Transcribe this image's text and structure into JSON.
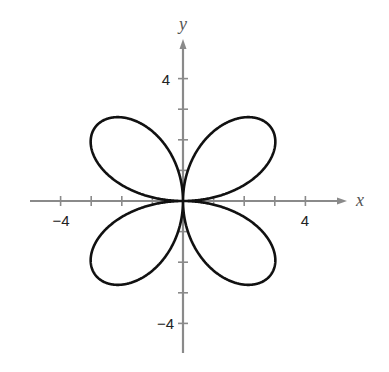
{
  "chart_data": {
    "type": "line",
    "title": "",
    "xlabel": "x",
    "ylabel": "y",
    "equation": "r = 4 sin 2θ",
    "xlim": [
      -5,
      5.3
    ],
    "ylim": [
      -5.1,
      5.2
    ],
    "x_tick_labels": [
      "-4",
      "4"
    ],
    "y_tick_labels": [
      "4",
      "-4"
    ],
    "x_ticks": [
      -4,
      -3,
      -2,
      -1,
      1,
      2,
      3,
      4
    ],
    "y_ticks": [
      -4,
      -3,
      -2,
      -1,
      1,
      2,
      3,
      4
    ],
    "grid": false,
    "series": [
      {
        "name": "rose curve",
        "polar": true,
        "r_amplitude": 4,
        "k": 2,
        "color": "#111111"
      }
    ]
  },
  "colors": {
    "axis": "#8a8a8a",
    "curve": "#111111"
  }
}
